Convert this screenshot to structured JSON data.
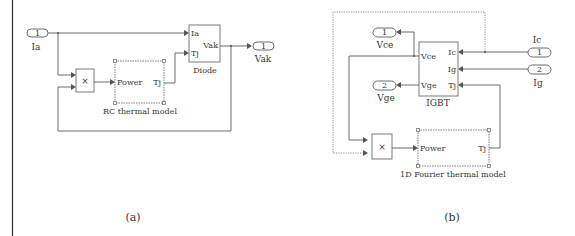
{
  "figure": {
    "panels": [
      {
        "caption": "(a)",
        "inports": [
          {
            "number": "1",
            "label": "Ia"
          }
        ],
        "outports": [
          {
            "number": "1",
            "label": "Vak"
          }
        ],
        "product_symbol": "×",
        "thermal_block": {
          "label": "RC thermal model",
          "input": "Power",
          "output": "Tj"
        },
        "device_block": {
          "label": "Diode",
          "inputs": [
            "Ia",
            "Tj"
          ],
          "outputs": [
            "Vak"
          ]
        }
      },
      {
        "caption": "(b)",
        "inports": [
          {
            "number": "1",
            "label": "Ic"
          },
          {
            "number": "2",
            "label": "Ig"
          }
        ],
        "outports": [
          {
            "number": "1",
            "label": "Vce"
          },
          {
            "number": "2",
            "label": "Vge"
          }
        ],
        "product_symbol": "×",
        "thermal_block": {
          "label": "1D Fourier thermal model",
          "input": "Power",
          "output": "Tj"
        },
        "device_block": {
          "label": "IGBT",
          "inputs": [
            "Ic",
            "Ig",
            "Tj"
          ],
          "outputs": [
            "Vce",
            "Vge"
          ]
        }
      }
    ]
  },
  "colors": {
    "line": "#6b6b6b",
    "text": "#333333",
    "background": "#ffffff"
  }
}
